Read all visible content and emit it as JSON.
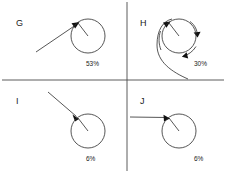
{
  "figure": {
    "type": "quadrant-trajectory-diagram",
    "width": 226,
    "height": 173,
    "background_color": "#ffffff",
    "line_color": "#2b2b2b",
    "axis_color": "#4a4a4a",
    "text_color": "#1a1a1a"
  },
  "axes": {
    "horizontal": {
      "y": 80,
      "x_start": 2,
      "x_end": 224
    },
    "vertical": {
      "x": 127,
      "y_start": 2,
      "y_end": 171
    }
  },
  "panels": [
    {
      "id": "G",
      "letter": "G",
      "percent": "53%",
      "percent_value": 53,
      "quadrant": "top-left",
      "circle": {
        "cx": 88,
        "cy": 36,
        "r": 17
      },
      "contact_point": {
        "x": 78,
        "y": 23
      },
      "has_spiral": false,
      "trajectory_kind": "straight-diagonal",
      "trajectory_start": {
        "x": 36,
        "y": 52
      }
    },
    {
      "id": "H",
      "letter": "H",
      "percent": "30%",
      "percent_value": 30,
      "quadrant": "top-right",
      "circle": {
        "cx": 179,
        "cy": 36,
        "r": 17
      },
      "contact_point": {
        "x": 169,
        "y": 23
      },
      "has_spiral": true,
      "trajectory_kind": "spiral-loop",
      "trajectory_start": {
        "x": 188,
        "y": 79
      }
    },
    {
      "id": "I",
      "letter": "I",
      "percent": "6%",
      "percent_value": 6,
      "quadrant": "bottom-left",
      "circle": {
        "cx": 88,
        "cy": 131,
        "r": 17
      },
      "contact_point": {
        "x": 78,
        "y": 118
      },
      "has_spiral": false,
      "trajectory_kind": "straight-diagonal",
      "trajectory_start": {
        "x": 48,
        "y": 92
      }
    },
    {
      "id": "J",
      "letter": "J",
      "percent": "6%",
      "percent_value": 6,
      "quadrant": "bottom-right",
      "circle": {
        "cx": 179,
        "cy": 131,
        "r": 17
      },
      "contact_point": {
        "x": 169,
        "y": 118
      },
      "has_spiral": false,
      "trajectory_kind": "straight-horizontal",
      "trajectory_start": {
        "x": 130,
        "y": 117
      }
    }
  ],
  "labels": {
    "letter_G": "G",
    "letter_H": "H",
    "letter_I": "I",
    "letter_J": "J",
    "percent_G": "53%",
    "percent_H": "30%",
    "percent_I": "6%",
    "percent_J": "6%"
  }
}
